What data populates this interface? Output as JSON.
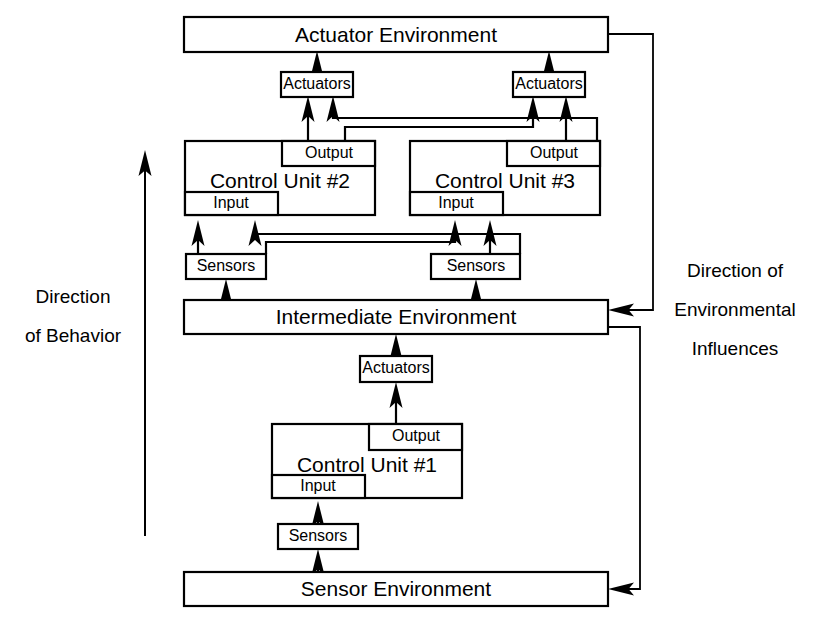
{
  "diagram": {
    "environments": [
      {
        "id": "actuator-environment",
        "label": "Actuator Environment"
      },
      {
        "id": "intermediate-environment",
        "label": "Intermediate Environment"
      },
      {
        "id": "sensor-environment",
        "label": "Sensor Environment"
      }
    ],
    "control_units": [
      {
        "id": "control-unit-1",
        "label": "Control Unit #1",
        "input_label": "Input",
        "output_label": "Output"
      },
      {
        "id": "control-unit-2",
        "label": "Control Unit #2",
        "input_label": "Input",
        "output_label": "Output"
      },
      {
        "id": "control-unit-3",
        "label": "Control Unit #3",
        "input_label": "Input",
        "output_label": "Output"
      }
    ],
    "actuator_blocks": [
      {
        "id": "actuators-1",
        "label": "Actuators"
      },
      {
        "id": "actuators-2",
        "label": "Actuators"
      },
      {
        "id": "actuators-3",
        "label": "Actuators"
      }
    ],
    "sensor_blocks": [
      {
        "id": "sensors-1",
        "label": "Sensors"
      },
      {
        "id": "sensors-2",
        "label": "Sensors"
      },
      {
        "id": "sensors-3",
        "label": "Sensors"
      }
    ],
    "side_labels": {
      "left": {
        "line1": "Direction",
        "line2": "of Behavior"
      },
      "right": {
        "line1": "Direction of",
        "line2": "Environmental",
        "line3": "Influences"
      }
    },
    "colors": {
      "stroke": "#000000",
      "fill": "#ffffff",
      "text": "#000000"
    }
  }
}
